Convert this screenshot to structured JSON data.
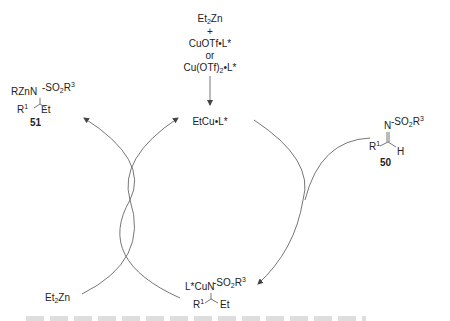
{
  "diagram": {
    "type": "catalytic-cycle",
    "reagents_top": {
      "line1_main": "Et",
      "line1_sub": "2",
      "line1_tail": "Zn",
      "plus": "+",
      "line2": "CuOTf•L*",
      "or": "or",
      "line3_main": "Cu(OTf)",
      "line3_sub": "2",
      "line3_tail": "•L*"
    },
    "catalyst": "EtCu•L*",
    "product_51": {
      "zn_n": "RZnN",
      "so2_main": "SO",
      "so2_sub": "2",
      "so2_r": "R",
      "so2_sup": "3",
      "r1": "R",
      "r1_sup": "1",
      "et": "Et",
      "label": "51"
    },
    "substrate_50": {
      "n": "N",
      "so2_main": "SO",
      "so2_sub": "2",
      "so2_r": "R",
      "so2_sup": "3",
      "r1": "R",
      "r1_sup": "1",
      "h": "H",
      "label": "50"
    },
    "intermediate": {
      "cu_n": "L*CuN",
      "so2_main": "SO",
      "so2_sub": "2",
      "so2_r": "R",
      "so2_sup": "3",
      "r1": "R",
      "r1_sup": "1",
      "et": "Et"
    },
    "reagent_bottom_left": {
      "main": "Et",
      "sub": "2",
      "tail": "Zn"
    },
    "colors": {
      "line": "#555555",
      "text": "#222222"
    }
  }
}
